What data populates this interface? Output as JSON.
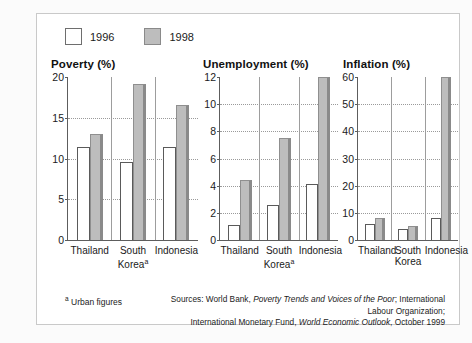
{
  "legend": {
    "items": [
      {
        "label": "1996",
        "key": "y1996",
        "color": "#ffffff"
      },
      {
        "label": "1998",
        "key": "y1998",
        "color": "#bdbdbd"
      }
    ]
  },
  "footnote": {
    "marker": "a",
    "text": "Urban figures"
  },
  "sources": {
    "line1_prefix": "Sources: World Bank, ",
    "line1_italic": "Poverty Trends and Voices of the Poor",
    "line1_suffix": "; International Labour Organization;",
    "line2_prefix": "International Monetary Fund, ",
    "line2_italic": "World Economic Outlook",
    "line2_suffix": ", October 1999"
  },
  "chart_data": [
    {
      "type": "bar",
      "title": "Poverty (%)",
      "categories": [
        "Thailand",
        "South Korea",
        "Indonesia"
      ],
      "category_footnote_marker": {
        "South Korea": "a"
      },
      "series": [
        {
          "name": "1996",
          "values": [
            11.4,
            9.6,
            11.4
          ]
        },
        {
          "name": "1998",
          "values": [
            13.0,
            19.2,
            16.6
          ]
        }
      ],
      "ylim": [
        0,
        20
      ],
      "yticks": [
        0,
        5,
        10,
        15,
        20
      ],
      "ylabel": "",
      "xlabel": "",
      "grid": true,
      "legend_position": "top-left"
    },
    {
      "type": "bar",
      "title": "Unemployment (%)",
      "categories": [
        "Thailand",
        "South Korea",
        "Indonesia"
      ],
      "category_footnote_marker": {
        "South Korea": "a"
      },
      "series": [
        {
          "name": "1996",
          "values": [
            1.1,
            2.6,
            4.1
          ]
        },
        {
          "name": "1998",
          "values": [
            4.4,
            7.5,
            12.0
          ]
        }
      ],
      "ylim": [
        0,
        12
      ],
      "yticks": [
        0,
        2,
        4,
        6,
        8,
        10,
        12
      ],
      "ylabel": "",
      "xlabel": "",
      "grid": true,
      "legend_position": "top-left"
    },
    {
      "type": "bar",
      "title": "Inflation (%)",
      "categories": [
        "Thailand",
        "South Korea",
        "Indonesia"
      ],
      "category_footnote_marker": {},
      "series": [
        {
          "name": "1996",
          "values": [
            5.8,
            4.0,
            8.0
          ]
        },
        {
          "name": "1998",
          "values": [
            8.0,
            5.2,
            60.0
          ]
        }
      ],
      "ylim": [
        0,
        60
      ],
      "yticks": [
        0,
        10,
        20,
        30,
        40,
        50,
        60
      ],
      "ylabel": "",
      "xlabel": "",
      "grid": true,
      "legend_position": "top-left"
    }
  ]
}
